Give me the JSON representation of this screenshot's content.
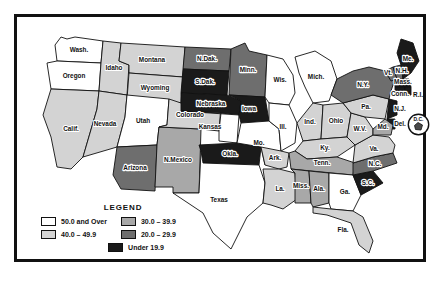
{
  "legend": {
    "title": "LEGEND",
    "column_left": [
      {
        "label": "50.0 and Over",
        "color": "#ffffff"
      },
      {
        "label": "40.0 – 49.9",
        "color": "#d3d3d3"
      }
    ],
    "column_right": [
      {
        "label": "30.0 – 39.9",
        "color": "#a8a8a8"
      },
      {
        "label": "20.0 – 29.9",
        "color": "#6e6e6e"
      }
    ],
    "bottom": {
      "label": "Under 19.9",
      "color": "#1a1a1a"
    }
  },
  "inset": {
    "label": "D.C."
  },
  "chart_data": {
    "type": "map",
    "title": "LEGEND",
    "map_region": "United States",
    "classes": [
      {
        "name": "50.0 and Over",
        "color": "#ffffff",
        "min": 50.0
      },
      {
        "name": "40.0 – 49.9",
        "color": "#d3d3d3",
        "min": 40.0,
        "max": 49.9
      },
      {
        "name": "30.0 – 39.9",
        "color": "#a8a8a8",
        "min": 30.0,
        "max": 39.9
      },
      {
        "name": "20.0 – 29.9",
        "color": "#6e6e6e",
        "min": 20.0,
        "max": 29.9
      },
      {
        "name": "Under 19.9",
        "color": "#1a1a1a",
        "max": 19.9
      }
    ],
    "states": [
      {
        "id": "WA",
        "label": "Wash.",
        "class": "50.0 and Over",
        "color": "#ffffff"
      },
      {
        "id": "OR",
        "label": "Oregon",
        "class": "50.0 and Over",
        "color": "#ffffff"
      },
      {
        "id": "ID",
        "label": "Idaho",
        "class": "40.0 – 49.9",
        "color": "#d3d3d3"
      },
      {
        "id": "MT",
        "label": "Montana",
        "class": "40.0 – 49.9",
        "color": "#d3d3d3"
      },
      {
        "id": "WY",
        "label": "Wyoming",
        "class": "40.0 – 49.9",
        "color": "#d3d3d3"
      },
      {
        "id": "CA",
        "label": "Calif.",
        "class": "40.0 – 49.9",
        "color": "#d3d3d3"
      },
      {
        "id": "NV",
        "label": "Nevada",
        "class": "40.0 – 49.9",
        "color": "#d3d3d3"
      },
      {
        "id": "UT",
        "label": "Utah",
        "class": "50.0 and Over",
        "color": "#ffffff"
      },
      {
        "id": "AZ",
        "label": "Arizona",
        "class": "20.0 – 29.9",
        "color": "#6e6e6e"
      },
      {
        "id": "NM",
        "label": "N.Mexico",
        "class": "30.0 – 39.9",
        "color": "#a8a8a8"
      },
      {
        "id": "CO",
        "label": "Colorado",
        "class": "40.0 – 49.9",
        "color": "#d3d3d3"
      },
      {
        "id": "ND",
        "label": "N.Dak.",
        "class": "20.0 – 29.9",
        "color": "#6e6e6e"
      },
      {
        "id": "SD",
        "label": "S.Dak.",
        "class": "Under 19.9",
        "color": "#1a1a1a"
      },
      {
        "id": "NE",
        "label": "Nebraska",
        "class": "Under 19.9",
        "color": "#1a1a1a"
      },
      {
        "id": "KS",
        "label": "Kansas",
        "class": "50.0 and Over",
        "color": "#ffffff"
      },
      {
        "id": "OK",
        "label": "Okla.",
        "class": "Under 19.9",
        "color": "#1a1a1a"
      },
      {
        "id": "TX",
        "label": "Texas",
        "class": "50.0 and Over",
        "color": "#ffffff"
      },
      {
        "id": "MN",
        "label": "Minn.",
        "class": "20.0 – 29.9",
        "color": "#6e6e6e"
      },
      {
        "id": "IA",
        "label": "Iowa",
        "class": "Under 19.9",
        "color": "#1a1a1a"
      },
      {
        "id": "MO",
        "label": "Mo.",
        "class": "50.0 and Over",
        "color": "#ffffff"
      },
      {
        "id": "AR",
        "label": "Ark.",
        "class": "40.0 – 49.9",
        "color": "#d3d3d3"
      },
      {
        "id": "LA",
        "label": "La.",
        "class": "40.0 – 49.9",
        "color": "#d3d3d3"
      },
      {
        "id": "WI",
        "label": "Wis.",
        "class": "50.0 and Over",
        "color": "#ffffff"
      },
      {
        "id": "IL",
        "label": "Ill.",
        "class": "50.0 and Over",
        "color": "#ffffff"
      },
      {
        "id": "MI",
        "label": "Mich.",
        "class": "50.0 and Over",
        "color": "#ffffff"
      },
      {
        "id": "IN",
        "label": "Ind.",
        "class": "40.0 – 49.9",
        "color": "#d3d3d3"
      },
      {
        "id": "OH",
        "label": "Ohio",
        "class": "40.0 – 49.9",
        "color": "#d3d3d3"
      },
      {
        "id": "KY",
        "label": "Ky.",
        "class": "40.0 – 49.9",
        "color": "#d3d3d3"
      },
      {
        "id": "TN",
        "label": "Tenn.",
        "class": "30.0 – 39.9",
        "color": "#a8a8a8"
      },
      {
        "id": "MS",
        "label": "Miss.",
        "class": "30.0 – 39.9",
        "color": "#a8a8a8"
      },
      {
        "id": "AL",
        "label": "Ala.",
        "class": "30.0 – 39.9",
        "color": "#a8a8a8"
      },
      {
        "id": "GA",
        "label": "Ga.",
        "class": "50.0 and Over",
        "color": "#ffffff"
      },
      {
        "id": "FL",
        "label": "Fla.",
        "class": "40.0 – 49.9",
        "color": "#d3d3d3"
      },
      {
        "id": "SC",
        "label": "S.C.",
        "class": "Under 19.9",
        "color": "#1a1a1a"
      },
      {
        "id": "NC",
        "label": "N.C.",
        "class": "20.0 – 29.9",
        "color": "#6e6e6e"
      },
      {
        "id": "VA",
        "label": "Va.",
        "class": "40.0 – 49.9",
        "color": "#d3d3d3"
      },
      {
        "id": "WV",
        "label": "W.V.",
        "class": "40.0 – 49.9",
        "color": "#d3d3d3"
      },
      {
        "id": "PA",
        "label": "Pa.",
        "class": "40.0 – 49.9",
        "color": "#d3d3d3"
      },
      {
        "id": "NY",
        "label": "N.Y.",
        "class": "20.0 – 29.9",
        "color": "#6e6e6e"
      },
      {
        "id": "VT",
        "label": "Vt.",
        "class": "20.0 – 29.9",
        "color": "#6e6e6e"
      },
      {
        "id": "NH",
        "label": "N.H.",
        "class": "20.0 – 29.9",
        "color": "#6e6e6e"
      },
      {
        "id": "ME",
        "label": "Me.",
        "class": "Under 19.9",
        "color": "#1a1a1a"
      },
      {
        "id": "MA",
        "label": "Mass.",
        "class": "Under 19.9",
        "color": "#1a1a1a"
      },
      {
        "id": "CT",
        "label": "Conn.",
        "class": "Under 19.9",
        "color": "#1a1a1a"
      },
      {
        "id": "RI",
        "label": "R.I.",
        "class": "Under 19.9",
        "color": "#1a1a1a"
      },
      {
        "id": "NJ",
        "label": "N.J.",
        "class": "Under 19.9",
        "color": "#1a1a1a"
      },
      {
        "id": "DE",
        "label": "Del.",
        "class": "Under 19.9",
        "color": "#1a1a1a"
      },
      {
        "id": "MD",
        "label": "Md.",
        "class": "30.0 – 39.9",
        "color": "#a8a8a8"
      },
      {
        "id": "DC",
        "label": "D.C.",
        "class": "20.0 – 29.9",
        "color": "#6e6e6e"
      }
    ]
  }
}
